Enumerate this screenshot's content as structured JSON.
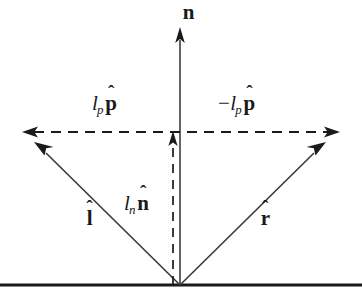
{
  "figure": {
    "background_color": "#ffffff",
    "ink_color": "#1a1a1a"
  },
  "surface": {
    "name": "reflecting-surface-line",
    "y": 285,
    "x_start": 0,
    "x_end": 362,
    "thickness": 3
  },
  "origin": {
    "label": "incidence-point",
    "x": 180,
    "y": 285
  },
  "labels": {
    "normal": {
      "scalar": "",
      "minus": "",
      "subscript": "",
      "unit": "n",
      "hat": "ˆ",
      "full_text": "n̂"
    },
    "parallel_left": {
      "scalar": "l",
      "minus": "",
      "subscript": "p",
      "unit": "p",
      "hat": "ˆ",
      "full_text": "lₚ p̂"
    },
    "parallel_right": {
      "scalar": "l",
      "minus": "−",
      "subscript": "p",
      "unit": "p",
      "hat": "ˆ",
      "full_text": "−lₚ p̂"
    },
    "normal_component": {
      "scalar": "l",
      "minus": "",
      "subscript": "n",
      "unit": "n",
      "hat": "ˆ",
      "full_text": "lₙ n̂"
    },
    "incident": {
      "scalar": "",
      "minus": "",
      "subscript": "",
      "unit": "l",
      "hat": "ˆ",
      "full_text": "l̂"
    },
    "reflected": {
      "scalar": "",
      "minus": "",
      "subscript": "",
      "unit": "r",
      "hat": "ˆ",
      "full_text": "r̂"
    }
  },
  "vectors": [
    {
      "name": "normal-vector",
      "style": "solid",
      "from": [
        180,
        285
      ],
      "to": [
        180,
        28
      ],
      "arrowhead": "end"
    },
    {
      "name": "incident-vector",
      "style": "solid",
      "from": [
        180,
        285
      ],
      "to": [
        35,
        143
      ],
      "arrowhead": "end"
    },
    {
      "name": "reflected-vector",
      "style": "solid",
      "from": [
        180,
        285
      ],
      "to": [
        325,
        143
      ],
      "arrowhead": "end"
    },
    {
      "name": "parallel-component-axis",
      "style": "dashed",
      "from": [
        338,
        132
      ],
      "to": [
        24,
        132
      ],
      "arrowhead": "both"
    },
    {
      "name": "normal-component-vector",
      "style": "dashed",
      "from": [
        173,
        285
      ],
      "to": [
        173,
        133
      ],
      "arrowhead": "end"
    }
  ]
}
